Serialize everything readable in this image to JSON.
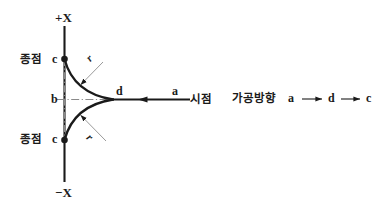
{
  "diagram": {
    "background_color": "#ffffff",
    "line_color": "#1a1a1a",
    "centerline_color": "#8a8a8a",
    "leader_color": "#9a9a9a",
    "axis": {
      "positive_label": "+X",
      "negative_label": "−X"
    },
    "points": {
      "b": "b",
      "d": "d",
      "a": "a",
      "c_upper": "c",
      "c_lower": "c"
    },
    "radius_labels": {
      "upper": "r",
      "lower": "r"
    },
    "annotations": {
      "end_point_upper": "종점",
      "end_point_lower": "종점",
      "start_point": "시점"
    }
  },
  "legend": {
    "title": "가공방향",
    "sequence": [
      "a",
      "d",
      "c"
    ],
    "arrow_glyph": "arrow-right"
  }
}
